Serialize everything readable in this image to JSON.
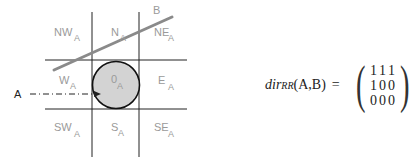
{
  "diagram": {
    "tiles": [
      {
        "id": "NW",
        "label": "NW",
        "sub": "A"
      },
      {
        "id": "N",
        "label": "N",
        "sub": "A"
      },
      {
        "id": "NE",
        "label": "NE",
        "sub": "A"
      },
      {
        "id": "W",
        "label": "W",
        "sub": "A"
      },
      {
        "id": "O",
        "label": "0",
        "sub": "A"
      },
      {
        "id": "E",
        "label": "E",
        "sub": "A"
      },
      {
        "id": "SW",
        "label": "SW",
        "sub": "A"
      },
      {
        "id": "S",
        "label": "S",
        "sub": "A"
      },
      {
        "id": "SE",
        "label": "SE",
        "sub": "A"
      }
    ],
    "reference_object_label": "A",
    "target_object_label": "B",
    "colors": {
      "grid": "#222222",
      "circle_fill": "#d3d3d3",
      "circle_stroke": "#111111",
      "object_b_line": "#8a8a8a",
      "tile_text": "#9a9a9a"
    }
  },
  "formula": {
    "function": "dir",
    "subscript": "RR",
    "arguments": "(A,B)",
    "equals": "=",
    "matrix": [
      [
        "1",
        "1",
        "1"
      ],
      [
        "1",
        "0",
        "0"
      ],
      [
        "0",
        "0",
        "0"
      ]
    ]
  }
}
